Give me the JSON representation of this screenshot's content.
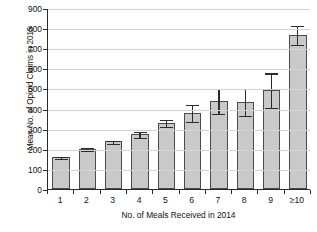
{
  "chart_data": {
    "type": "bar",
    "title": "",
    "xlabel": "No. of Meals Received in 2014",
    "ylabel": "Mean No. of Opioid Claims in 2015",
    "categories": [
      "1",
      "2",
      "3",
      "4",
      "5",
      "6",
      "7",
      "8",
      "9",
      "≥10"
    ],
    "values": [
      160,
      202,
      238,
      275,
      330,
      380,
      440,
      435,
      495,
      770
    ],
    "errors_low": [
      5,
      6,
      8,
      14,
      18,
      42,
      60,
      65,
      88,
      47
    ],
    "errors_high": [
      5,
      6,
      8,
      14,
      18,
      42,
      62,
      68,
      85,
      47
    ],
    "yticks": [
      0,
      100,
      200,
      300,
      400,
      500,
      600,
      700,
      800,
      900
    ],
    "ylim": [
      0,
      900
    ],
    "grid": "horizontal",
    "legend": "none",
    "bar_color": "#c9c9c9",
    "bar_edge_color": "#4a4a4a",
    "error_color": "#2b2b2b",
    "axis_color": "#2b2b2b",
    "grid_color": "#d3d3d3",
    "background": "#ffffff"
  }
}
